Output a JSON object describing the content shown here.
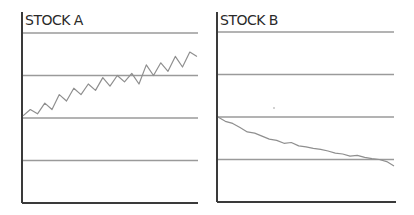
{
  "chart_data": [
    {
      "type": "line",
      "title": "STOCK A",
      "xlabel": "",
      "ylabel": "",
      "ylim": [
        0,
        4.3
      ],
      "grid": true,
      "gridlines": [
        1,
        2,
        3,
        4
      ],
      "tick_labels_shown": false,
      "x": [
        0,
        1,
        2,
        3,
        4,
        5,
        6,
        7,
        8,
        9,
        10,
        11,
        12,
        13,
        14,
        15,
        16,
        17,
        18,
        19,
        20,
        21,
        22,
        23,
        24
      ],
      "series": [
        {
          "name": "Stock A",
          "color": "#8f8f8f",
          "values": [
            2.05,
            2.2,
            2.1,
            2.35,
            2.2,
            2.55,
            2.4,
            2.7,
            2.55,
            2.8,
            2.65,
            2.95,
            2.75,
            3.0,
            2.85,
            3.05,
            2.8,
            3.25,
            3.0,
            3.3,
            3.1,
            3.45,
            3.2,
            3.55,
            3.45
          ]
        }
      ],
      "trend": "rising, zigzag"
    },
    {
      "type": "line",
      "title": "STOCK B",
      "xlabel": "",
      "ylabel": "",
      "ylim": [
        0,
        4.3
      ],
      "grid": true,
      "gridlines": [
        1,
        2,
        3,
        4
      ],
      "tick_labels_shown": false,
      "x": [
        0,
        1,
        2,
        3,
        4,
        5,
        6,
        7,
        8,
        9,
        10,
        11,
        12,
        13,
        14,
        15,
        16,
        17,
        18,
        19,
        20,
        21,
        22,
        23,
        24
      ],
      "series": [
        {
          "name": "Stock B",
          "color": "#8f8f8f",
          "values": [
            2.0,
            1.9,
            1.85,
            1.75,
            1.65,
            1.62,
            1.55,
            1.48,
            1.45,
            1.38,
            1.4,
            1.32,
            1.3,
            1.26,
            1.24,
            1.2,
            1.15,
            1.13,
            1.08,
            1.1,
            1.05,
            1.02,
            1.0,
            0.95,
            0.85
          ]
        }
      ],
      "trend": "falling, steady"
    }
  ],
  "panels": [
    {
      "title": "STOCK A"
    },
    {
      "title": "STOCK B"
    }
  ],
  "colors": {
    "axis": "#3a3a3a",
    "grid": "#9a9a9a",
    "series": "#8f8f8f",
    "title": "#2a2a2a"
  }
}
